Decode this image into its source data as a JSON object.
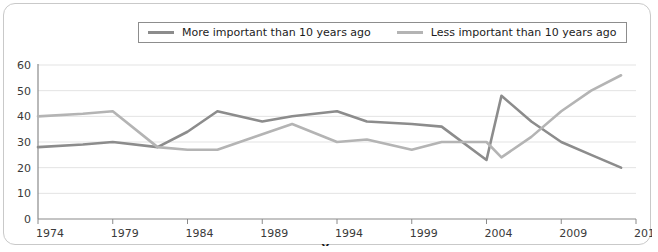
{
  "legend": {
    "entries": [
      {
        "label": "More important than 10 years ago",
        "color": "#8c8c8c",
        "icon": "legend-line-icon"
      },
      {
        "label": "Less important than 10 years ago",
        "color": "#b4b4b4",
        "icon": "legend-line-icon"
      }
    ]
  },
  "chart_data": {
    "type": "line",
    "title": "",
    "xlabel": "Years",
    "ylabel": "",
    "xlim": [
      1974,
      2014
    ],
    "ylim": [
      0,
      60
    ],
    "grid": true,
    "legend_position": "top-center",
    "x_ticks": [
      "1974",
      "1979",
      "1984",
      "1989",
      "1994",
      "1999",
      "2004",
      "2009",
      "2014"
    ],
    "y_ticks": [
      "0",
      "10",
      "20",
      "30",
      "40",
      "50",
      "60"
    ],
    "x": [
      1974,
      1977,
      1979,
      1982,
      1984,
      1986,
      1989,
      1991,
      1994,
      1996,
      1999,
      2001,
      2004,
      2005,
      2007,
      2009,
      2011,
      2013
    ],
    "series": [
      {
        "name": "More important than 10 years ago",
        "color": "#8c8c8c",
        "values": [
          28,
          29,
          30,
          28,
          34,
          42,
          38,
          40,
          42,
          38,
          37,
          36,
          23,
          48,
          38,
          30,
          25,
          20
        ]
      },
      {
        "name": "Less important than 10 years ago",
        "color": "#b4b4b4",
        "values": [
          40,
          41,
          42,
          28,
          27,
          27,
          33,
          37,
          30,
          31,
          27,
          30,
          30,
          24,
          32,
          42,
          50,
          56
        ]
      }
    ]
  }
}
